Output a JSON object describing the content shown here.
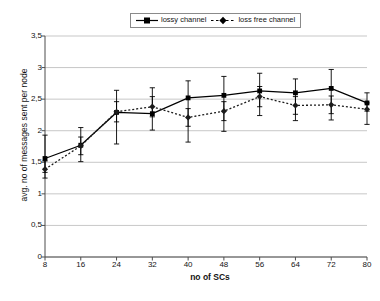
{
  "chart_data": {
    "type": "line",
    "title": "",
    "xlabel": "no of SCs",
    "ylabel": "avg. no of messages sent per node",
    "x": [
      8,
      16,
      24,
      32,
      40,
      48,
      56,
      64,
      72,
      80
    ],
    "xticklabels": [
      "8",
      "16",
      "24",
      "32",
      "40",
      "48",
      "56",
      "64",
      "72",
      "80"
    ],
    "yticklabels": [
      "0",
      "0,5",
      "1",
      "1,5",
      "2",
      "2,5",
      "3",
      "3,5"
    ],
    "ytickvalues": [
      0,
      0.5,
      1,
      1.5,
      2,
      2.5,
      3,
      3.5
    ],
    "ylim": [
      0,
      3.5
    ],
    "xlim": [
      8,
      80
    ],
    "grid": "horizontal",
    "legend_position": "top-center",
    "series": [
      {
        "name": "lossy channel",
        "marker": "square",
        "linestyle": "solid",
        "color": "#000000",
        "values": [
          1.56,
          1.77,
          2.29,
          2.27,
          2.52,
          2.56,
          2.63,
          2.6,
          2.67,
          2.44
        ],
        "err_low": [
          1.34,
          1.51,
          1.79,
          2.01,
          1.82,
          1.99,
          2.24,
          2.16,
          2.17,
          2.31
        ],
        "err_high": [
          1.93,
          2.05,
          2.64,
          2.68,
          2.79,
          2.86,
          2.91,
          2.82,
          2.97,
          2.6
        ]
      },
      {
        "name": "loss free channel",
        "marker": "diamond",
        "linestyle": "dotted",
        "color": "#1c1c1c",
        "values": [
          1.39,
          1.76,
          2.3,
          2.38,
          2.21,
          2.31,
          2.54,
          2.4,
          2.41,
          2.34
        ],
        "err_low": [
          1.25,
          1.62,
          2.14,
          2.22,
          2.07,
          2.16,
          2.38,
          2.26,
          2.27,
          2.1
        ],
        "err_high": [
          1.52,
          1.9,
          2.46,
          2.54,
          2.35,
          2.46,
          2.7,
          2.54,
          2.55,
          2.44
        ]
      }
    ]
  },
  "legend": {
    "items": [
      {
        "label": "lossy channel"
      },
      {
        "label": "loss free channel"
      }
    ],
    "separator": "-"
  },
  "axes": {
    "x_title": "no of SCs",
    "y_title": "avg. no of messages sent per node"
  }
}
